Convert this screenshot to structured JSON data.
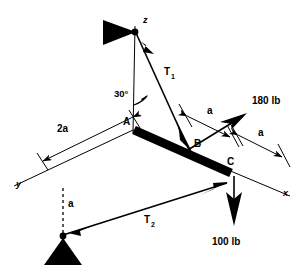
{
  "figure": {
    "background_color": "#ffffff",
    "line_color": "#000000"
  },
  "axes": [
    {
      "name": "z-axis",
      "label": "z"
    },
    {
      "name": "x-axis",
      "label": "x"
    },
    {
      "name": "y-axis",
      "label": "y"
    }
  ],
  "points": [
    {
      "name": "point-a",
      "label": "A"
    },
    {
      "name": "point-b",
      "label": "B"
    },
    {
      "name": "point-c",
      "label": "C"
    }
  ],
  "cables": [
    {
      "name": "cable-t1",
      "label": "T",
      "subscript": "1"
    },
    {
      "name": "cable-t2",
      "label": "T",
      "subscript": "2"
    }
  ],
  "angles": [
    {
      "name": "angle-30",
      "label": "30°"
    }
  ],
  "dimensions": [
    {
      "name": "dimension-2a",
      "label": "2a"
    },
    {
      "name": "dimension-a-upper-right",
      "label": "a"
    },
    {
      "name": "dimension-a-lower-right",
      "label": "a"
    },
    {
      "name": "dimension-a-vertical",
      "label": "a"
    }
  ],
  "forces": [
    {
      "name": "force-180lb",
      "label": "180 lb",
      "magnitude": 180,
      "unit": "lb",
      "direction": "up-right"
    },
    {
      "name": "force-100lb",
      "label": "100 lb",
      "magnitude": 100,
      "unit": "lb",
      "direction": "down"
    }
  ],
  "supports": [
    {
      "name": "support-top",
      "type": "triangle-anchor"
    },
    {
      "name": "support-bottom",
      "type": "triangle-anchor"
    }
  ]
}
